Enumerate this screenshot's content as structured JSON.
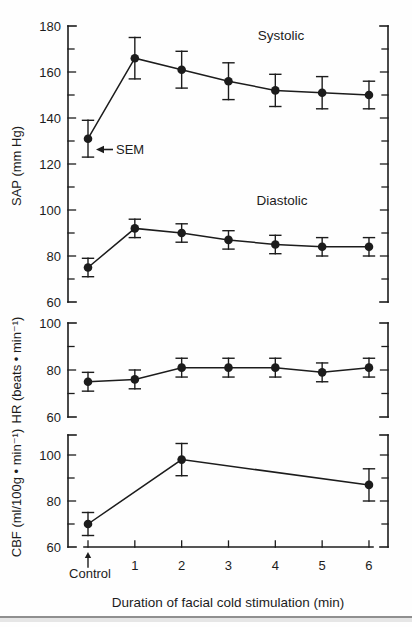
{
  "figure": {
    "ink_color": "#1c1c1c",
    "x_axis": {
      "title": "Duration of facial cold stimulation (min)",
      "categories": [
        "Control",
        "1",
        "2",
        "3",
        "4",
        "5",
        "6"
      ]
    },
    "sem_label": "SEM"
  },
  "chart_data": [
    {
      "id": "sap",
      "type": "line",
      "ylabel": "SAP (mm Hg)",
      "ylim": [
        60,
        180
      ],
      "yticks": [
        60,
        80,
        100,
        120,
        140,
        160,
        180
      ],
      "ytick_minor_step": 10,
      "error_bars": "SEM",
      "series": [
        {
          "name": "Systolic",
          "x": [
            0,
            1,
            2,
            3,
            4,
            5,
            6
          ],
          "values": [
            131,
            166,
            161,
            156,
            152,
            151,
            150
          ],
          "sem": [
            8,
            9,
            8,
            8,
            7,
            7,
            6
          ]
        },
        {
          "name": "Diastolic",
          "x": [
            0,
            1,
            2,
            3,
            4,
            5,
            6
          ],
          "values": [
            75,
            92,
            90,
            87,
            85,
            84,
            84
          ],
          "sem": [
            4,
            4,
            4,
            4,
            4,
            4,
            4
          ]
        }
      ]
    },
    {
      "id": "hr",
      "type": "line",
      "ylabel": "HR (beats • min⁻¹)",
      "ylim": [
        60,
        100
      ],
      "yticks": [
        60,
        80,
        100
      ],
      "ytick_minor_step": 10,
      "error_bars": "SEM",
      "series": [
        {
          "name": "HR",
          "x": [
            0,
            1,
            2,
            3,
            4,
            5,
            6
          ],
          "values": [
            75,
            76,
            81,
            81,
            81,
            79,
            81
          ],
          "sem": [
            4,
            4,
            4,
            4,
            4,
            4,
            4
          ]
        }
      ]
    },
    {
      "id": "cbf",
      "type": "line",
      "ylabel": "CBF (ml/100g • min⁻¹)",
      "ylim": [
        60,
        108
      ],
      "yticks": [
        60,
        80,
        100
      ],
      "ytick_minor_step": 10,
      "error_bars": "SEM",
      "series": [
        {
          "name": "CBF",
          "x": [
            0,
            2,
            6
          ],
          "values": [
            70,
            98,
            87
          ],
          "sem": [
            5,
            7,
            7
          ]
        }
      ]
    }
  ]
}
